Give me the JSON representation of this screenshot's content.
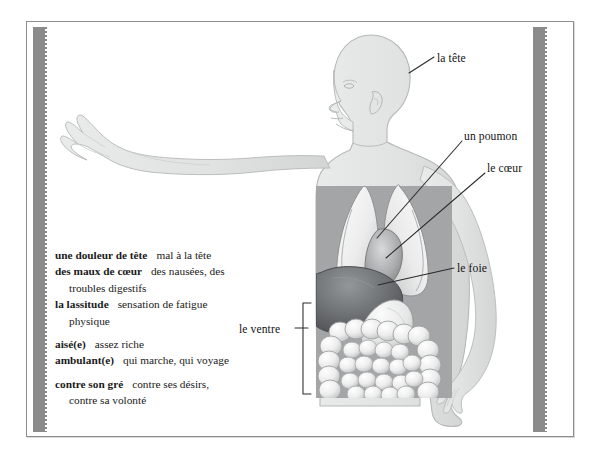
{
  "page": {
    "language": "French",
    "figure_alt": "human body profile with internal organs"
  },
  "glossary": {
    "entries": [
      {
        "term": "une douleur de tête",
        "definition": "mal à la tête",
        "continuation": ""
      },
      {
        "term": "des maux de cœur",
        "definition": "des nausées, des",
        "continuation": "troubles digestifs"
      },
      {
        "term": "la lassitude",
        "definition": "sensation de fatigue",
        "continuation": "physique"
      },
      {
        "term": "aisé(e)",
        "definition": "assez riche",
        "continuation": ""
      },
      {
        "term": "ambulant(e)",
        "definition": "qui marche, qui voyage",
        "continuation": ""
      },
      {
        "term": "contre son gré",
        "definition": "contre ses désirs,",
        "continuation": "contre sa volonté"
      }
    ]
  },
  "labels": {
    "tete": "la tête",
    "poumon": "un poumon",
    "coeur": "le cœur",
    "foie": "le foie",
    "ventre": "le ventre"
  },
  "colors": {
    "gutter": "#8b8b8b",
    "frame": "#8d8d8d",
    "body_fill": "#e3e4e4",
    "body_stroke": "#b9bbbb",
    "organ_light": "#f4f4f4",
    "organ_mid": "#c9cacb",
    "liver": "#6f7173",
    "cavity": "#9a9c9d",
    "leader_line": "#2a2a2a",
    "text": "#141414",
    "page": "#ffffff"
  }
}
